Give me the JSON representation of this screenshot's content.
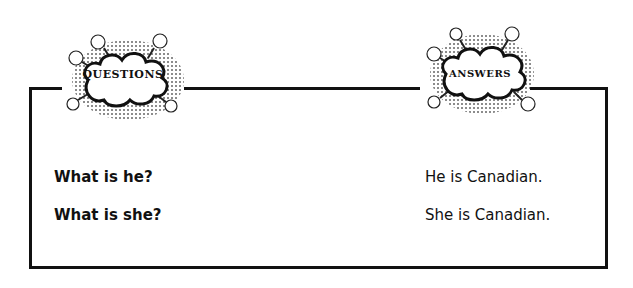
{
  "headers": {
    "questions": "QUESTIONS",
    "answers": "ANSWERS"
  },
  "rows": [
    {
      "question": "What is he?",
      "answer": "He is Canadian."
    },
    {
      "question": "What is she?",
      "answer": "She is Canadian."
    }
  ]
}
